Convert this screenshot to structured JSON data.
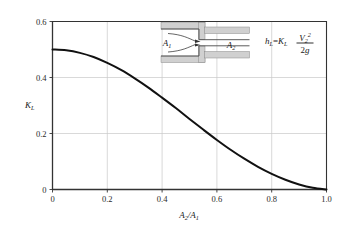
{
  "chart_data": {
    "type": "line",
    "title": "",
    "xlabel": "A2/A1",
    "ylabel": "KL",
    "xlim": [
      0,
      1.0
    ],
    "ylim": [
      0,
      0.6
    ],
    "grid": true,
    "legend": false,
    "xticks": [
      "0",
      "0.2",
      "0.4",
      "0.6",
      "0.8",
      "1.0"
    ],
    "xtick_values": [
      0,
      0.2,
      0.4,
      0.6,
      0.8,
      1.0
    ],
    "yticks": [
      "0",
      "0.2",
      "0.4",
      "0.6"
    ],
    "ytick_values": [
      0,
      0.2,
      0.4,
      0.6
    ],
    "series": [
      {
        "name": "Sudden contraction loss coefficient",
        "x": [
          0.0,
          0.05,
          0.1,
          0.15,
          0.2,
          0.25,
          0.3,
          0.35,
          0.4,
          0.45,
          0.5,
          0.55,
          0.6,
          0.65,
          0.7,
          0.75,
          0.8,
          0.85,
          0.9,
          0.95,
          1.0
        ],
        "values": [
          0.5,
          0.497,
          0.488,
          0.473,
          0.452,
          0.427,
          0.397,
          0.364,
          0.328,
          0.291,
          0.252,
          0.214,
          0.177,
          0.142,
          0.11,
          0.081,
          0.056,
          0.035,
          0.018,
          0.006,
          0.0
        ]
      }
    ]
  },
  "axes": {
    "y_label_main": "K",
    "y_label_sub": "L",
    "x_label_num": "A",
    "x_label_num_sub": "2",
    "x_label_slash": "/",
    "x_label_den": "A",
    "x_label_den_sub": "1"
  },
  "inset": {
    "upstream_area_label": "A",
    "upstream_area_sub": "1",
    "downstream_area_label": "A",
    "downstream_area_sub": "2",
    "diagram_name": "sudden-contraction-pipe"
  },
  "equation": {
    "lhs_var": "h",
    "lhs_sub": "L",
    "equals": "=",
    "coeff_var": "K",
    "coeff_sub": "L",
    "numerator_var": "V",
    "numerator_sub": "2",
    "numerator_sup": "2",
    "denominator_num": "2",
    "denominator_var": "g"
  },
  "colors": {
    "curve": "#111111",
    "axis": "#333333",
    "grid": "#c8c8c8",
    "wall_fill": "#d0d0d0",
    "wall_stroke": "#777777",
    "streamline": "#555555",
    "background": "#ffffff"
  }
}
